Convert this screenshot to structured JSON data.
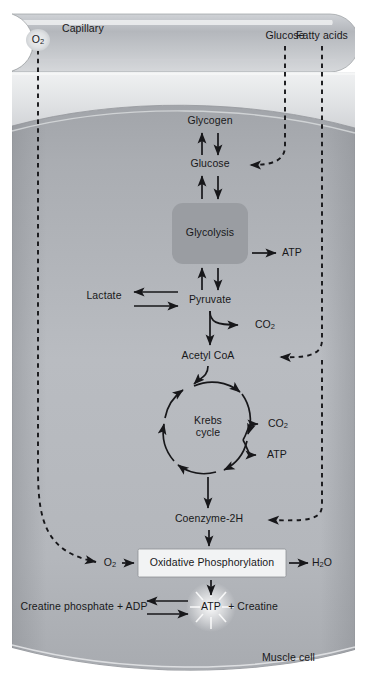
{
  "figure": {
    "regions": {
      "capillary_label": "Capillary",
      "cell_label": "Muscle cell"
    },
    "colors": {
      "page_background": "#ffffff",
      "capillary_fill": "#b9bcc0",
      "capillary_highlight": "#e8eaec",
      "cell_fill": "#a9acb1",
      "cytosol_fill": "#b6b9be",
      "interstitium_fill": "#dcdee1",
      "glycolysis_box": "#9a9da2",
      "oxphos_box": "#f2f3f4",
      "arrow_stroke": "#17171a",
      "text": "#18181a"
    }
  },
  "transported_substances": [
    {
      "id": "o2-capillary",
      "label": "O",
      "subscript": "2",
      "x": 38,
      "y": 40
    },
    {
      "id": "glucose-blood",
      "label": "Glucose",
      "subscript": "",
      "x": 285,
      "y": 36
    },
    {
      "id": "fatty-acids",
      "label": "Fatty acids",
      "subscript": "",
      "x": 322,
      "y": 36
    }
  ],
  "nodes": [
    {
      "id": "glycogen",
      "label": "Glycogen",
      "subscript": "",
      "x": 210,
      "y": 121,
      "type": "metabolite"
    },
    {
      "id": "glucose",
      "label": "Glucose",
      "subscript": "",
      "x": 210,
      "y": 164,
      "type": "metabolite"
    },
    {
      "id": "glycolysis",
      "label": "Glycolysis",
      "subscript": "",
      "x": 210,
      "y": 233,
      "type": "process-box"
    },
    {
      "id": "atp-glyco",
      "label": "ATP",
      "subscript": "",
      "x": 292,
      "y": 253,
      "type": "product"
    },
    {
      "id": "lactate",
      "label": "Lactate",
      "subscript": "",
      "x": 104,
      "y": 296,
      "type": "metabolite"
    },
    {
      "id": "pyruvate",
      "label": "Pyruvate",
      "subscript": "",
      "x": 210,
      "y": 300,
      "type": "metabolite"
    },
    {
      "id": "co2-pyruvate",
      "label": "CO",
      "subscript": "2",
      "x": 265,
      "y": 325,
      "type": "product"
    },
    {
      "id": "acetyl-coa",
      "label": "Acetyl CoA",
      "subscript": "",
      "x": 208,
      "y": 356,
      "type": "metabolite"
    },
    {
      "id": "krebs",
      "label": "Krebs",
      "label2": "cycle",
      "subscript": "",
      "x": 208,
      "y": 432,
      "type": "cycle"
    },
    {
      "id": "co2-krebs",
      "label": "CO",
      "subscript": "2",
      "x": 278,
      "y": 424,
      "type": "product"
    },
    {
      "id": "atp-krebs",
      "label": "ATP",
      "subscript": "",
      "x": 277,
      "y": 455,
      "type": "product"
    },
    {
      "id": "coenzyme-2h",
      "label": "Coenzyme-2H",
      "subscript": "",
      "x": 209,
      "y": 519,
      "type": "metabolite"
    },
    {
      "id": "o2-cell",
      "label": "O",
      "subscript": "2",
      "x": 110,
      "y": 563,
      "type": "metabolite"
    },
    {
      "id": "oxphos",
      "label": "Oxidative Phosphorylation",
      "subscript": "",
      "x": 212,
      "y": 563,
      "type": "process-box"
    },
    {
      "id": "h2o",
      "label": "H",
      "subscript": "2",
      "label_tail": "O",
      "x": 322,
      "y": 563,
      "type": "product"
    },
    {
      "id": "creatine-phosphate-adp",
      "label": "Creatine phosphate + ADP",
      "subscript": "",
      "x": 84,
      "y": 607,
      "type": "metabolite"
    },
    {
      "id": "atp-creatine",
      "label": "ATP",
      "subscript": "",
      "x": 211,
      "y": 607,
      "type": "product"
    },
    {
      "id": "creatine",
      "label": "+ Creatine",
      "subscript": "",
      "x": 253,
      "y": 607,
      "type": "metabolite"
    }
  ],
  "reactions": [
    {
      "from": "glycogen",
      "to": "glucose",
      "style": "bidirectional"
    },
    {
      "from": "glucose",
      "to": "glycolysis",
      "style": "bidirectional"
    },
    {
      "from": "glycolysis",
      "to": "atp-glyco",
      "style": "single"
    },
    {
      "from": "glycolysis",
      "to": "pyruvate",
      "style": "bidirectional"
    },
    {
      "from": "pyruvate",
      "to": "lactate",
      "style": "bidirectional"
    },
    {
      "from": "pyruvate",
      "to": "co2-pyruvate",
      "style": "single"
    },
    {
      "from": "pyruvate",
      "to": "acetyl-coa",
      "style": "single"
    },
    {
      "from": "acetyl-coa",
      "to": "krebs",
      "style": "single"
    },
    {
      "from": "krebs",
      "to": "co2-krebs",
      "style": "single"
    },
    {
      "from": "krebs",
      "to": "atp-krebs",
      "style": "single"
    },
    {
      "from": "krebs",
      "to": "coenzyme-2h",
      "style": "single"
    },
    {
      "from": "coenzyme-2h",
      "to": "oxphos",
      "style": "single"
    },
    {
      "from": "o2-cell",
      "to": "oxphos",
      "style": "single"
    },
    {
      "from": "oxphos",
      "to": "h2o",
      "style": "single"
    },
    {
      "from": "oxphos",
      "to": "atp-creatine",
      "style": "single"
    },
    {
      "from": "atp-creatine",
      "to": "creatine-phosphate-adp",
      "style": "bidirectional"
    },
    {
      "from": "o2-capillary",
      "to": "o2-cell",
      "style": "dashed-transport"
    },
    {
      "from": "glucose-blood",
      "to": "glucose",
      "style": "dashed-transport"
    },
    {
      "from": "fatty-acids",
      "to": "acetyl-coa",
      "style": "dashed-transport"
    },
    {
      "from": "fatty-acids",
      "to": "coenzyme-2h",
      "style": "dashed-transport"
    }
  ]
}
